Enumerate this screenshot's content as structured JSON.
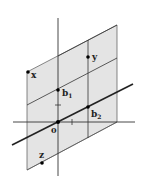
{
  "diagram": {
    "type": "lattice-plane",
    "colors": {
      "plane_fill": "#e4e4e4",
      "line": "#333333",
      "background": "#ffffff"
    },
    "points": [
      {
        "id": "origin",
        "label": "0",
        "sub": ""
      },
      {
        "id": "b1",
        "label": "b",
        "sub": "1"
      },
      {
        "id": "b2",
        "label": "b",
        "sub": "2"
      },
      {
        "id": "x",
        "label": "x",
        "sub": ""
      },
      {
        "id": "y",
        "label": "y",
        "sub": ""
      },
      {
        "id": "z",
        "label": "z",
        "sub": ""
      }
    ],
    "ticks": [
      {
        "axis": "vertical",
        "label": "unit tick"
      },
      {
        "axis": "horizontal",
        "label": "unit tick"
      }
    ]
  }
}
